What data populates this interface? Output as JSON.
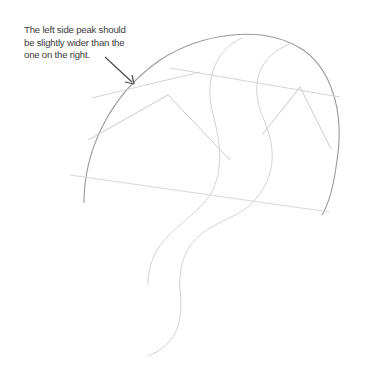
{
  "annotation": {
    "line1": "The left side peak should",
    "line2": "be slightly wider than the",
    "line3": "one on the right."
  },
  "colors": {
    "background": "#ffffff",
    "text": "#3b3b3b",
    "arrow": "#4a4a4a",
    "outline": "#9a9a9a",
    "guide": "#c8c8c8"
  }
}
